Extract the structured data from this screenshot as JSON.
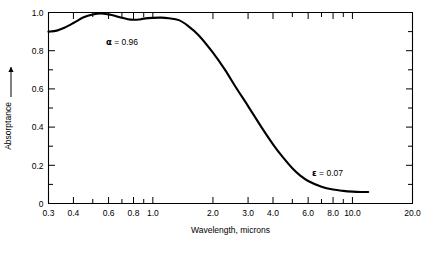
{
  "figure": {
    "background_color": "#ffffff",
    "line_color": "#000000",
    "width": 432,
    "height": 254
  },
  "chart_data": {
    "type": "line",
    "title": "",
    "xlabel": "Wavelength, microns",
    "ylabel": "Absorptance",
    "ylabel_arrow": "↑",
    "xscale": "log",
    "yscale": "linear",
    "xlim": [
      0.3,
      20.0
    ],
    "ylim": [
      0.0,
      1.0
    ],
    "grid": false,
    "legend": "none",
    "xticks": [
      0.3,
      0.4,
      0.5,
      0.6,
      0.7,
      0.8,
      0.9,
      1.0,
      2.0,
      3.0,
      4.0,
      5.0,
      6.0,
      7.0,
      8.0,
      9.0,
      10.0,
      20.0
    ],
    "xticklabels": [
      {
        "value": 0.3,
        "label": "0.3"
      },
      {
        "value": 0.4,
        "label": "0.4"
      },
      {
        "value": 0.6,
        "label": "0.6"
      },
      {
        "value": 0.8,
        "label": "0.8"
      },
      {
        "value": 1.0,
        "label": "1.0"
      },
      {
        "value": 2.0,
        "label": "2.0"
      },
      {
        "value": 3.0,
        "label": "3.0"
      },
      {
        "value": 4.0,
        "label": "4.0"
      },
      {
        "value": 6.0,
        "label": "6.0"
      },
      {
        "value": 8.0,
        "label": "8.0"
      },
      {
        "value": 10.0,
        "label": "10.0"
      },
      {
        "value": 20.0,
        "label": "20.0"
      }
    ],
    "yticks": [
      0.0,
      0.1,
      0.2,
      0.3,
      0.4,
      0.5,
      0.6,
      0.7,
      0.8,
      0.9,
      1.0
    ],
    "yticklabels": [
      {
        "value": 0.0,
        "label": "0"
      },
      {
        "value": 0.2,
        "label": "0.2"
      },
      {
        "value": 0.4,
        "label": "0.4"
      },
      {
        "value": 0.6,
        "label": "0.6"
      },
      {
        "value": 0.8,
        "label": "0.8"
      },
      {
        "value": 1.0,
        "label": "1.0"
      }
    ],
    "series": [
      {
        "name": "absorptance",
        "points": [
          [
            0.3,
            0.9
          ],
          [
            0.33,
            0.905
          ],
          [
            0.36,
            0.92
          ],
          [
            0.4,
            0.945
          ],
          [
            0.45,
            0.975
          ],
          [
            0.5,
            0.99
          ],
          [
            0.55,
            0.995
          ],
          [
            0.6,
            0.99
          ],
          [
            0.65,
            0.982
          ],
          [
            0.7,
            0.972
          ],
          [
            0.75,
            0.965
          ],
          [
            0.8,
            0.962
          ],
          [
            0.85,
            0.963
          ],
          [
            0.9,
            0.968
          ],
          [
            1.0,
            0.972
          ],
          [
            1.1,
            0.973
          ],
          [
            1.2,
            0.97
          ],
          [
            1.35,
            0.96
          ],
          [
            1.5,
            0.93
          ],
          [
            1.7,
            0.88
          ],
          [
            2.0,
            0.79
          ],
          [
            2.3,
            0.7
          ],
          [
            2.6,
            0.61
          ],
          [
            3.0,
            0.51
          ],
          [
            3.5,
            0.4
          ],
          [
            4.0,
            0.31
          ],
          [
            4.5,
            0.24
          ],
          [
            5.0,
            0.185
          ],
          [
            5.5,
            0.145
          ],
          [
            6.0,
            0.118
          ],
          [
            7.0,
            0.088
          ],
          [
            8.0,
            0.073
          ],
          [
            9.0,
            0.066
          ],
          [
            10.0,
            0.062
          ],
          [
            11.0,
            0.06
          ],
          [
            12.0,
            0.06
          ]
        ]
      }
    ],
    "annotations": [
      {
        "name": "alpha-annotation",
        "symbol": "α",
        "text": " = 0.96",
        "full": "α = 0.96",
        "x_px": 106,
        "y_px": 45
      },
      {
        "name": "epsilon-annotation",
        "symbol": "ε",
        "text": " = 0.07",
        "full": "ε = 0.07",
        "x_px": 312,
        "y_px": 176
      }
    ]
  }
}
